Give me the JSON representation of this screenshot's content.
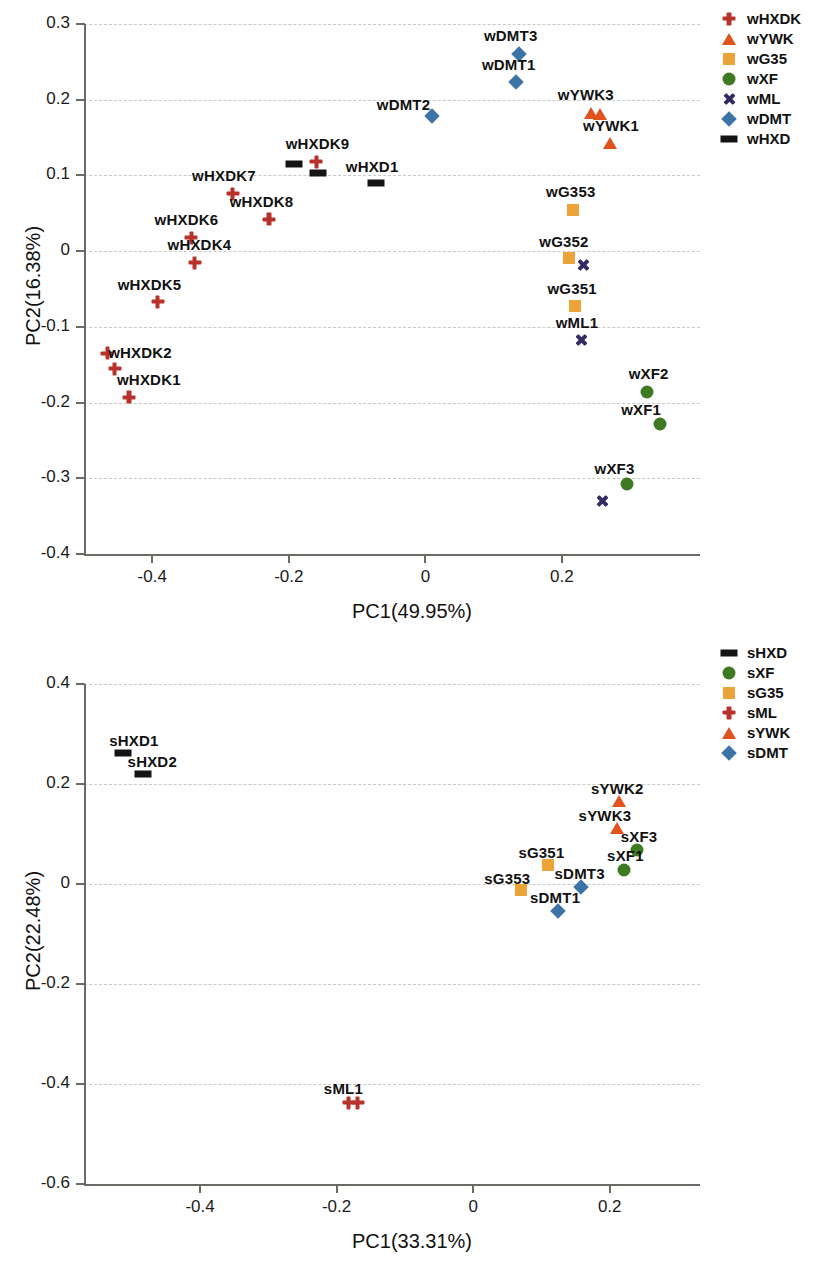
{
  "colors": {
    "HXDK_ML": "#b8312a",
    "YWK": "#e2521d",
    "G35": "#eda338",
    "XF": "#3f7a23",
    "ML_x": "#352a63",
    "DMT": "#3c74a6",
    "HXD": "#141414",
    "axis": "#6b6b66",
    "grid": "#c9c9c4"
  },
  "chart_data": [
    {
      "type": "scatter",
      "id": "top",
      "title": "",
      "xlabel": "PC1(49.95%)",
      "ylabel": "PC2(16.38%)",
      "xlim": [
        -0.5,
        0.37
      ],
      "ylim": [
        -0.4,
        0.3
      ],
      "xticks": [
        -0.4,
        -0.2,
        0,
        0.2
      ],
      "xtick_labels": [
        "-0.4",
        "-0.2",
        "0",
        "0.2"
      ],
      "yticks": [
        0.3,
        0.2,
        0.1,
        0,
        -0.1,
        -0.2,
        -0.3,
        -0.4
      ],
      "ytick_labels": [
        "0.3",
        "0.2",
        "0.1",
        "0",
        "-0.1",
        "-0.2",
        "-0.3",
        "-0.4"
      ],
      "grid": true,
      "legend_position": "right-top",
      "legend": [
        {
          "label": "wHXDK",
          "marker": "cross",
          "color": "#b8312a"
        },
        {
          "label": "wYWK",
          "marker": "triangle",
          "color": "#e2521d"
        },
        {
          "label": "wG35",
          "marker": "square",
          "color": "#eda338"
        },
        {
          "label": "wXF",
          "marker": "circle",
          "color": "#3f7a23"
        },
        {
          "label": "wML",
          "marker": "x",
          "color": "#352a63"
        },
        {
          "label": "wDMT",
          "marker": "diamond",
          "color": "#3c74a6"
        },
        {
          "label": "wHXD",
          "marker": "bar",
          "color": "#141414"
        }
      ],
      "points": [
        {
          "label": "wHXDK1",
          "x": -0.434,
          "y": -0.193,
          "marker": "cross",
          "color": "#b8312a",
          "lx": -0.405,
          "ly": -0.169
        },
        {
          "label": "wHXDK2",
          "x": -0.455,
          "y": -0.155,
          "marker": "cross",
          "color": "#b8312a",
          "lx": -0.418,
          "ly": -0.133
        },
        {
          "label": "",
          "x": -0.466,
          "y": -0.135,
          "marker": "cross",
          "color": "#b8312a",
          "lx": null,
          "ly": null
        },
        {
          "label": "wHXDK5",
          "x": -0.392,
          "y": -0.067,
          "marker": "cross",
          "color": "#b8312a",
          "lx": -0.404,
          "ly": -0.043
        },
        {
          "label": "wHXDK4",
          "x": -0.338,
          "y": -0.015,
          "marker": "cross",
          "color": "#b8312a",
          "lx": -0.331,
          "ly": 0.01
        },
        {
          "label": "wHXDK6",
          "x": -0.343,
          "y": 0.018,
          "marker": "cross",
          "color": "#b8312a",
          "lx": -0.35,
          "ly": 0.042
        },
        {
          "label": "wHXDK7",
          "x": -0.282,
          "y": 0.076,
          "marker": "cross",
          "color": "#b8312a",
          "lx": -0.295,
          "ly": 0.1
        },
        {
          "label": "wHXDK8",
          "x": -0.229,
          "y": 0.042,
          "marker": "cross",
          "color": "#b8312a",
          "lx": -0.24,
          "ly": 0.066
        },
        {
          "label": "wHXDK9",
          "x": -0.16,
          "y": 0.118,
          "marker": "cross",
          "color": "#b8312a",
          "lx": -0.158,
          "ly": 0.143
        },
        {
          "label": "",
          "x": -0.192,
          "y": 0.115,
          "marker": "bar",
          "color": "#141414",
          "lx": null,
          "ly": null
        },
        {
          "label": "",
          "x": -0.157,
          "y": 0.103,
          "marker": "bar",
          "color": "#141414",
          "lx": null,
          "ly": null
        },
        {
          "label": "wHXD1",
          "x": -0.073,
          "y": 0.09,
          "marker": "bar",
          "color": "#141414",
          "lx": -0.078,
          "ly": 0.113
        },
        {
          "label": "wDMT2",
          "x": 0.01,
          "y": 0.179,
          "marker": "diamond",
          "color": "#3c74a6",
          "lx": -0.032,
          "ly": 0.194
        },
        {
          "label": "wDMT1",
          "x": 0.133,
          "y": 0.224,
          "marker": "diamond",
          "color": "#3c74a6",
          "lx": 0.122,
          "ly": 0.247
        },
        {
          "label": "wDMT3",
          "x": 0.137,
          "y": 0.261,
          "marker": "diamond",
          "color": "#3c74a6",
          "lx": 0.125,
          "ly": 0.285
        },
        {
          "label": "wYWK3",
          "x": 0.243,
          "y": 0.182,
          "marker": "triangle",
          "color": "#e2521d",
          "lx": 0.235,
          "ly": 0.207
        },
        {
          "label": "",
          "x": 0.256,
          "y": 0.181,
          "marker": "triangle",
          "color": "#e2521d",
          "lx": null,
          "ly": null
        },
        {
          "label": "wYWK1",
          "x": 0.271,
          "y": 0.143,
          "marker": "triangle",
          "color": "#e2521d",
          "lx": 0.272,
          "ly": 0.167
        },
        {
          "label": "wG353",
          "x": 0.216,
          "y": 0.054,
          "marker": "square",
          "color": "#eda338",
          "lx": 0.213,
          "ly": 0.079
        },
        {
          "label": "wG352",
          "x": 0.211,
          "y": -0.009,
          "marker": "square",
          "color": "#eda338",
          "lx": 0.203,
          "ly": 0.014
        },
        {
          "label": "",
          "x": 0.232,
          "y": -0.018,
          "marker": "x",
          "color": "#352a63",
          "lx": null,
          "ly": null
        },
        {
          "label": "wG351",
          "x": 0.219,
          "y": -0.073,
          "marker": "square",
          "color": "#eda338",
          "lx": 0.215,
          "ly": -0.049
        },
        {
          "label": "wML1",
          "x": 0.228,
          "y": -0.117,
          "marker": "x",
          "color": "#352a63",
          "lx": 0.222,
          "ly": -0.093
        },
        {
          "label": "wXF2",
          "x": 0.325,
          "y": -0.186,
          "marker": "circle",
          "color": "#3f7a23",
          "lx": 0.327,
          "ly": -0.161
        },
        {
          "label": "wXF1",
          "x": 0.343,
          "y": -0.228,
          "marker": "circle",
          "color": "#3f7a23",
          "lx": 0.316,
          "ly": -0.209
        },
        {
          "label": "wXF3",
          "x": 0.295,
          "y": -0.308,
          "marker": "circle",
          "color": "#3f7a23",
          "lx": 0.277,
          "ly": -0.287
        },
        {
          "label": "",
          "x": 0.259,
          "y": -0.33,
          "marker": "x",
          "color": "#352a63",
          "lx": null,
          "ly": null
        }
      ]
    },
    {
      "type": "scatter",
      "id": "bottom",
      "title": "",
      "xlabel": "PC1(33.31%)",
      "ylabel": "PC2(22.48%)",
      "xlim": [
        -0.57,
        0.3
      ],
      "ylim": [
        -0.6,
        0.4
      ],
      "xticks": [
        -0.4,
        -0.2,
        0,
        0.2
      ],
      "xtick_labels": [
        "-0.4",
        "-0.2",
        "0",
        "0.2"
      ],
      "yticks": [
        0.4,
        0.2,
        0,
        -0.2,
        -0.4,
        -0.6
      ],
      "ytick_labels": [
        "0.4",
        "0.2",
        "0",
        "-0.2",
        "-0.4",
        "-0.6"
      ],
      "grid": true,
      "legend_position": "right-top",
      "legend": [
        {
          "label": "sHXD",
          "marker": "bar",
          "color": "#141414"
        },
        {
          "label": "sXF",
          "marker": "circle",
          "color": "#3f7a23"
        },
        {
          "label": "sG35",
          "marker": "square",
          "color": "#eda338"
        },
        {
          "label": "sML",
          "marker": "cross",
          "color": "#b8312a"
        },
        {
          "label": "sYWK",
          "marker": "triangle",
          "color": "#e2521d"
        },
        {
          "label": "sDMT",
          "marker": "diamond",
          "color": "#3c74a6"
        }
      ],
      "points": [
        {
          "label": "sHXD1",
          "x": -0.513,
          "y": 0.262,
          "marker": "bar",
          "color": "#141414",
          "lx": -0.497,
          "ly": 0.288
        },
        {
          "label": "sHXD2",
          "x": -0.484,
          "y": 0.221,
          "marker": "bar",
          "color": "#141414",
          "lx": -0.47,
          "ly": 0.247
        },
        {
          "label": "sML1",
          "x": -0.182,
          "y": -0.437,
          "marker": "cross",
          "color": "#b8312a",
          "lx": -0.19,
          "ly": -0.408
        },
        {
          "label": "",
          "x": -0.169,
          "y": -0.437,
          "marker": "cross",
          "color": "#b8312a",
          "lx": null,
          "ly": null
        },
        {
          "label": "sG353",
          "x": 0.07,
          "y": -0.012,
          "marker": "square",
          "color": "#eda338",
          "lx": 0.05,
          "ly": 0.013
        },
        {
          "label": "sG351",
          "x": 0.109,
          "y": 0.039,
          "marker": "square",
          "color": "#eda338",
          "lx": 0.1,
          "ly": 0.065
        },
        {
          "label": "sDMT1",
          "x": 0.124,
          "y": -0.054,
          "marker": "diamond",
          "color": "#3c74a6",
          "lx": 0.12,
          "ly": -0.026
        },
        {
          "label": "sDMT3",
          "x": 0.158,
          "y": -0.005,
          "marker": "diamond",
          "color": "#3c74a6",
          "lx": 0.156,
          "ly": 0.022
        },
        {
          "label": "sYWK2",
          "x": 0.214,
          "y": 0.166,
          "marker": "triangle",
          "color": "#e2521d",
          "lx": 0.211,
          "ly": 0.192
        },
        {
          "label": "sYWK3",
          "x": 0.211,
          "y": 0.112,
          "marker": "triangle",
          "color": "#e2521d",
          "lx": 0.193,
          "ly": 0.138
        },
        {
          "label": "sXF3",
          "x": 0.24,
          "y": 0.068,
          "marker": "circle",
          "color": "#3f7a23",
          "lx": 0.243,
          "ly": 0.097
        },
        {
          "label": "sXF1",
          "x": 0.221,
          "y": 0.029,
          "marker": "circle",
          "color": "#3f7a23",
          "lx": 0.223,
          "ly": 0.058
        }
      ]
    }
  ]
}
